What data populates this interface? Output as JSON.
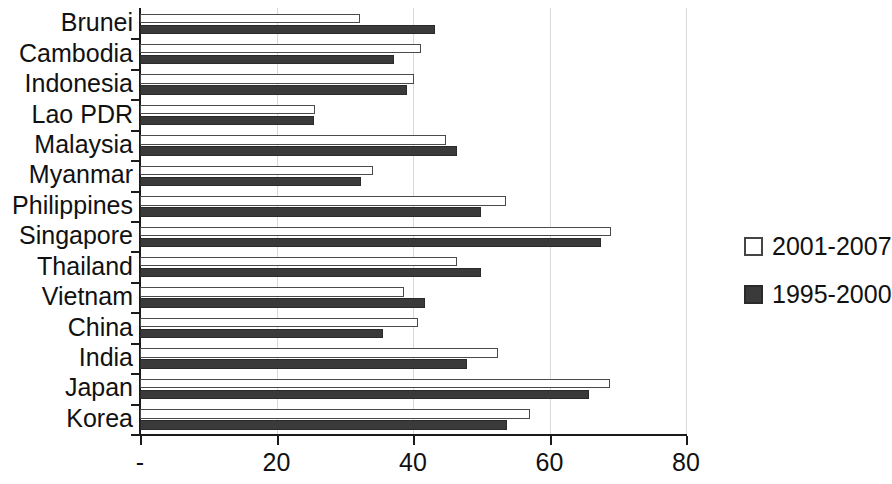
{
  "chart_data": {
    "type": "bar",
    "orientation": "horizontal",
    "title": "",
    "subtitle": "",
    "xlabel": "",
    "ylabel": "",
    "xlim": [
      0,
      80
    ],
    "xticks": [
      0,
      20,
      40,
      60,
      80
    ],
    "xtick_labels": [
      "-",
      "20",
      "40",
      "60",
      "80"
    ],
    "grid": true,
    "grid_axis": "x",
    "legend_position": "right",
    "categories": [
      "Brunei",
      "Cambodia",
      "Indonesia",
      "Lao PDR",
      "Malaysia",
      "Myanmar",
      "Philippines",
      "Singapore",
      "Thailand",
      "Vietnam",
      "China",
      "India",
      "Japan",
      "Korea"
    ],
    "series": [
      {
        "name": "2001-2007",
        "color": "#ffffff",
        "edge_color": "#4a4a4a",
        "values": [
          32.2,
          41.2,
          40.1,
          25.6,
          44.8,
          34.2,
          53.6,
          69.0,
          46.4,
          38.7,
          40.7,
          52.5,
          68.8,
          57.1
        ]
      },
      {
        "name": "1995-2000",
        "color": "#3a3a3a",
        "edge_color": "#2a2a2a",
        "values": [
          43.2,
          37.2,
          39.1,
          25.5,
          46.4,
          32.4,
          50.0,
          67.5,
          50.0,
          41.8,
          35.6,
          47.9,
          65.8,
          53.8
        ]
      }
    ]
  },
  "legend": {
    "items": [
      {
        "label": "2001-2007",
        "swatch": "light"
      },
      {
        "label": "1995-2000",
        "swatch": "dark"
      }
    ]
  }
}
